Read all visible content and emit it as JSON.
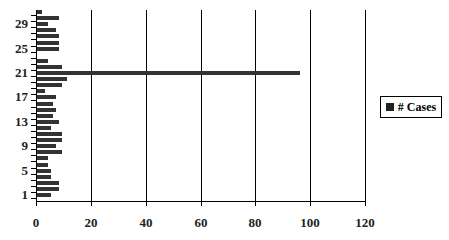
{
  "chart_data": {
    "type": "bar",
    "orientation": "horizontal",
    "title": "",
    "xlabel": "",
    "ylabel": "",
    "xlim": [
      0,
      120
    ],
    "x_ticks": [
      0,
      20,
      40,
      60,
      80,
      100,
      120
    ],
    "y_tick_labels": [
      "1",
      "5",
      "9",
      "13",
      "17",
      "21",
      "25",
      "29"
    ],
    "categories": [
      1,
      2,
      3,
      4,
      5,
      6,
      7,
      8,
      9,
      10,
      11,
      12,
      13,
      14,
      15,
      16,
      17,
      18,
      19,
      20,
      21,
      22,
      23,
      24,
      25,
      26,
      27,
      28,
      29,
      30,
      31
    ],
    "series": [
      {
        "name": "# Cases",
        "color": "#333333",
        "values": [
          5,
          8,
          8,
          5,
          5,
          4,
          4,
          9,
          7,
          9,
          9,
          5,
          8,
          6,
          7,
          6,
          7,
          3,
          9,
          11,
          96,
          9,
          4,
          0,
          8,
          8,
          8,
          7,
          4,
          8,
          2
        ]
      }
    ],
    "grid": {
      "vertical": true,
      "horizontal": false
    },
    "legend": {
      "position": "right",
      "entries": [
        "# Cases"
      ]
    }
  },
  "legend": {
    "label": "# Cases"
  },
  "x_axis": {
    "labels": [
      "0",
      "20",
      "40",
      "60",
      "80",
      "100",
      "120"
    ]
  },
  "y_axis": {
    "labels": [
      "1",
      "5",
      "9",
      "13",
      "17",
      "21",
      "25",
      "29"
    ]
  }
}
